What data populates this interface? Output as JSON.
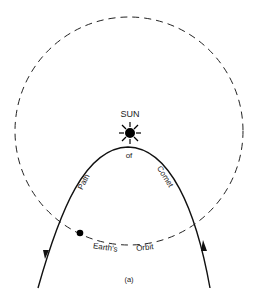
{
  "diagram": {
    "sun_label": "SUN",
    "path_words": [
      "Path",
      "of",
      "Comet"
    ],
    "orbit_words": [
      "Earth's",
      "Orbit"
    ],
    "caption": "(a)",
    "icons": {
      "sun": "sun-icon",
      "earth": "earth-dot-icon",
      "arrow_in": "arrowhead-icon",
      "arrow_out": "arrowhead-icon"
    },
    "colors": {
      "stroke": "#111111",
      "text": "#222222",
      "background": "#ffffff"
    }
  }
}
